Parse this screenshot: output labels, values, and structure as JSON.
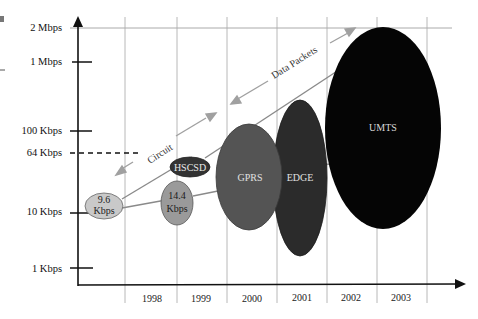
{
  "diagram": {
    "title": "",
    "y_axis": {
      "ticks": [
        {
          "label": "2 Mbps",
          "y": 28,
          "style": "grid"
        },
        {
          "label": "1 Mbps",
          "y": 62,
          "style": "tick"
        },
        {
          "label": "100 Kbps",
          "y": 131,
          "style": "tick"
        },
        {
          "label": "64 Kbps",
          "y": 153,
          "style": "dashed"
        },
        {
          "label": "10 Kbps",
          "y": 212,
          "style": "tick"
        },
        {
          "label": "1 Kbps",
          "y": 268,
          "style": "tick"
        }
      ]
    },
    "x_axis": {
      "years": [
        {
          "label": "1998",
          "x": 152
        },
        {
          "label": "1999",
          "x": 201
        },
        {
          "label": "2000",
          "x": 252
        },
        {
          "label": "2001",
          "x": 302
        },
        {
          "label": "2002",
          "x": 351
        },
        {
          "label": "2003",
          "x": 401
        }
      ]
    },
    "technologies": [
      {
        "name": "9.6 Kbps",
        "line1": "9.6",
        "line2": "Kbps",
        "cx": 104,
        "cy": 206,
        "rx": 19,
        "ry": 13,
        "fill": "#c9c9c9",
        "text_color": "#222222"
      },
      {
        "name": "14.4 Kbps",
        "line1": "14.4",
        "line2": "Kbps",
        "cx": 177,
        "cy": 203,
        "rx": 16,
        "ry": 22,
        "fill": "#9a9a9a",
        "text_color": "#1a1a1a"
      },
      {
        "name": "HSCSD",
        "line1": "HSCSD",
        "line2": "",
        "cx": 190,
        "cy": 167,
        "rx": 20,
        "ry": 10,
        "fill": "#333333",
        "text_color": "#e8e8e8"
      },
      {
        "name": "GPRS",
        "line1": "GPRS",
        "line2": "",
        "cx": 249,
        "cy": 177,
        "rx": 33,
        "ry": 53,
        "fill": "#545454",
        "text_color": "#e0e0e0"
      },
      {
        "name": "EDGE",
        "line1": "EDGE",
        "line2": "",
        "cx": 300,
        "cy": 178,
        "rx": 27,
        "ry": 78,
        "fill": "#2b2b2b",
        "text_color": "#e0e0e0"
      },
      {
        "name": "UMTS",
        "line1": "UMTS",
        "line2": "",
        "cx": 383,
        "cy": 128,
        "rx": 58,
        "ry": 101,
        "fill": "#050505",
        "text_color": "#d8d8d8"
      }
    ],
    "annotations": {
      "circuit": "Circuit",
      "data_packets": "Data Packets"
    },
    "colors": {
      "axis": "#111111",
      "grid": "#b5b5b5",
      "connector": "#8a8a8a",
      "annotation_arrow": "#9a9a9a"
    }
  }
}
